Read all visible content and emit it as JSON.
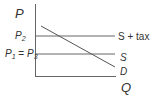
{
  "diagram": {
    "title": "",
    "axes": {
      "y_label": "P",
      "x_label": "Q"
    },
    "price_labels": {
      "p2_main": "P",
      "p2_sub": "2",
      "p1_main": "P",
      "p1_sub": "1",
      "eq": " = ",
      "p3_main": "P",
      "p3_sub": "3"
    },
    "curves": [
      {
        "id": "s_plus_tax",
        "label": "S + tax",
        "type": "horizontal",
        "level": "P2"
      },
      {
        "id": "s",
        "label": "S",
        "type": "horizontal",
        "level": "P1 = P3"
      },
      {
        "id": "d",
        "label": "D",
        "type": "downward-sloping"
      }
    ],
    "colors": {
      "line": "#555555",
      "text": "#333333",
      "background": "#ffffff"
    }
  }
}
